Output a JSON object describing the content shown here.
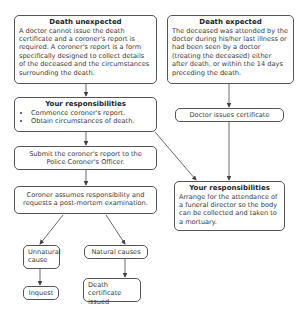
{
  "diagram": {
    "nodes": {
      "death_unexpected": {
        "title": "Death unexpected",
        "text": "A doctor cannot issue the death certificate and a coroner's report is required. A coroner's report is a form specifically designed to collect details of the deceased and the circumstances surrounding the death."
      },
      "death_expected": {
        "title": "Death expected",
        "text": "The deceased was attended by the doctor during his/her last illness or had been seen by a doctor (treating the deceased) either after death, or within the 14 days preceding the death."
      },
      "your_responsibilities_left": {
        "title": "Your responsibilities",
        "items": [
          "Commence coroner's report.",
          "Obtain circumstances of death."
        ]
      },
      "doctor_issues_certificate": {
        "text": "Doctor issues certificate"
      },
      "submit_report": {
        "text": "Submit the coroner's report to the Police Coroner's Officer."
      },
      "your_responsibilities_right": {
        "title": "Your responsibilities",
        "text": "Arrange for the attendance of a funeral director so the body can be collected and taken to a mortuary."
      },
      "coroner_assumes": {
        "text": "Coroner assumes responsibility and requests a post-mortem examination."
      },
      "unnatural_cause": {
        "text": "Unnatural cause"
      },
      "natural_causes": {
        "text": "Natural causes"
      },
      "inquest": {
        "text": "Inquest"
      },
      "death_certificate_issued": {
        "text": "Death certificate issued"
      }
    },
    "colors": {
      "border": "#555555",
      "text": "#3a3a3a",
      "arrow": "#444444"
    }
  }
}
